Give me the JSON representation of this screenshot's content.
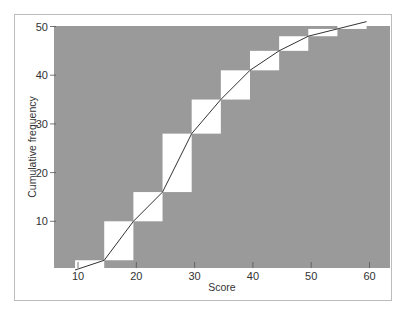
{
  "chart_data": {
    "type": "line",
    "subtype": "cumulative frequency ogive over step histogram",
    "title": "",
    "xlabel": "Score",
    "ylabel": "Cumulative frequency",
    "xlim": [
      7,
      63
    ],
    "ylim": [
      0,
      51
    ],
    "x_ticks": [
      10,
      20,
      30,
      40,
      50,
      60
    ],
    "y_ticks": [
      10,
      20,
      30,
      40,
      50
    ],
    "grid": false,
    "legend": null,
    "colors": {
      "plot_background": "#9a9a9a",
      "steps": "#ffffff",
      "line": "#333333",
      "frame": "#bcbcbc"
    },
    "steps": [
      {
        "x_start": 9.5,
        "x_end": 14.5,
        "cum_low": 0,
        "cum_high": 2
      },
      {
        "x_start": 14.5,
        "x_end": 19.5,
        "cum_low": 2,
        "cum_high": 10
      },
      {
        "x_start": 19.5,
        "x_end": 24.5,
        "cum_low": 10,
        "cum_high": 16
      },
      {
        "x_start": 24.5,
        "x_end": 29.5,
        "cum_low": 16,
        "cum_high": 28
      },
      {
        "x_start": 29.5,
        "x_end": 34.5,
        "cum_low": 28,
        "cum_high": 35
      },
      {
        "x_start": 34.5,
        "x_end": 39.5,
        "cum_low": 35,
        "cum_high": 41
      },
      {
        "x_start": 39.5,
        "x_end": 44.5,
        "cum_low": 41,
        "cum_high": 45
      },
      {
        "x_start": 44.5,
        "x_end": 49.5,
        "cum_low": 45,
        "cum_high": 48
      },
      {
        "x_start": 49.5,
        "x_end": 54.5,
        "cum_low": 48,
        "cum_high": 49.5
      },
      {
        "x_start": 54.5,
        "x_end": 59.5,
        "cum_low": 49.5,
        "cum_high": 51
      }
    ],
    "series": [
      {
        "name": "Cumulative frequency",
        "x": [
          9.5,
          14.5,
          19.5,
          24.5,
          29.5,
          34.5,
          39.5,
          44.5,
          49.5,
          54.5,
          59.5
        ],
        "values": [
          0,
          2,
          10,
          16,
          28,
          35,
          41,
          45,
          48,
          49.5,
          51
        ]
      }
    ]
  }
}
